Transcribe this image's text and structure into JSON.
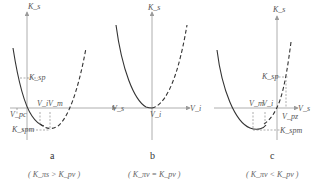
{
  "panels": [
    {
      "caption": "a",
      "condition": "( K_πs > K_pv )",
      "labels": {
        "y_axis": "K_s",
        "x_axis": "V_s",
        "k_sp": "K_sp",
        "v_pc": "V_pc",
        "v_i": "V_i",
        "v_m": "V_m",
        "k_spm": "K_spm"
      }
    },
    {
      "caption": "b",
      "condition": "( K_πv = K_pv )",
      "labels": {
        "y_axis": "K_s",
        "x_axis": "V_i",
        "v_i": "V_i"
      }
    },
    {
      "caption": "c",
      "condition": "( K_πv < K_pv )",
      "labels": {
        "y_axis": "K_s",
        "x_axis": "V_s",
        "k_sp": "K_sp",
        "v_pz": "V_pz",
        "v_i": "V_i",
        "v_m": "V_m",
        "k_spm": "K_spm"
      }
    }
  ],
  "colors": {
    "axis": "#9a9a9a",
    "curve": "#333333",
    "guide": "#777777"
  }
}
